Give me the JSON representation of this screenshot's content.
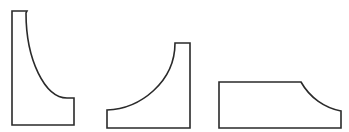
{
  "diagram": {
    "background": "#ffffff",
    "stroke_color": "#2a2a2a",
    "shapes": [
      {
        "name": "tall-cove-profile",
        "description": "Tall profile with concave quarter-curve on the right side",
        "path": "M 12 11 L 27 11 L 26 13 C 26 60, 45 98, 67 98 L 74 98 L 74 125 L 12 125 Z"
      },
      {
        "name": "mirrored-cove-profile",
        "description": "Profile with concave curve rising from lower-left to upper-right",
        "path": "M 107 110 C 140 109, 175 82, 175 43 L 190 43 L 190 128 L 107 128 Z"
      },
      {
        "name": "low-cove-profile",
        "description": "Low wide profile with concave curve at top-right corner",
        "path": "M 219 82 L 301 82 C 310 98, 325 108, 341 111 L 341 128 L 219 128 Z"
      }
    ]
  }
}
